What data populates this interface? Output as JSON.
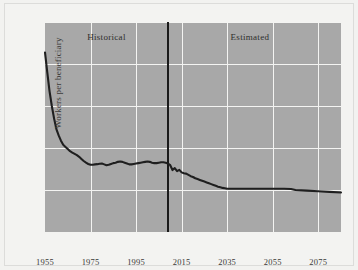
{
  "chart_data": {
    "type": "line",
    "title": "",
    "subtitle": "",
    "xlabel": "",
    "ylabel": "Workers per beneficiary",
    "xlim": [
      1955,
      2085
    ],
    "ylim": [
      0,
      10
    ],
    "grid": true,
    "legend_position": "none",
    "y_ticks": [
      "10",
      "8",
      "6",
      "4",
      "2",
      "0"
    ],
    "y_tick_values": [
      10,
      8,
      6,
      4,
      2,
      0
    ],
    "x_ticks": [
      "1955",
      "1975",
      "1995",
      "2015",
      "2035",
      "2055",
      "2075"
    ],
    "x_tick_values": [
      1955,
      1975,
      1995,
      2015,
      2035,
      2055,
      2075
    ],
    "annotations": [
      {
        "text": "Historical",
        "x": 1982,
        "y": 9.3
      },
      {
        "text": "Estimated",
        "x": 2045,
        "y": 9.3
      }
    ],
    "divider": {
      "x": 2009,
      "label": "historical-estimated-boundary"
    },
    "colors": {
      "plot_background": "#a8a8a8",
      "figure_background": "#f3f3f1",
      "gridline": "#f4f4f2",
      "series_line": "#1f1f1f",
      "divider_line": "#1a1a1a",
      "tick_text": "#3a3a38"
    },
    "series": [
      {
        "name": "Workers per beneficiary",
        "x": [
          1955,
          1956,
          1957,
          1958,
          1959,
          1960,
          1961,
          1962,
          1963,
          1964,
          1965,
          1966,
          1967,
          1968,
          1969,
          1970,
          1971,
          1972,
          1973,
          1974,
          1975,
          1976,
          1977,
          1978,
          1979,
          1980,
          1981,
          1982,
          1983,
          1984,
          1985,
          1986,
          1987,
          1988,
          1989,
          1990,
          1991,
          1992,
          1993,
          1994,
          1995,
          1996,
          1997,
          1998,
          1999,
          2000,
          2001,
          2002,
          2003,
          2004,
          2005,
          2006,
          2007,
          2008,
          2009,
          2010,
          2011,
          2012,
          2013,
          2014,
          2015,
          2016,
          2017,
          2018,
          2019,
          2020,
          2021,
          2022,
          2023,
          2024,
          2025,
          2026,
          2027,
          2028,
          2029,
          2030,
          2031,
          2032,
          2033,
          2034,
          2035,
          2040,
          2045,
          2050,
          2055,
          2060,
          2063,
          2065,
          2070,
          2075,
          2080,
          2085
        ],
        "y": [
          8.55,
          7.6,
          6.7,
          6.0,
          5.4,
          4.9,
          4.6,
          4.35,
          4.15,
          4.05,
          3.95,
          3.85,
          3.78,
          3.72,
          3.66,
          3.58,
          3.48,
          3.38,
          3.3,
          3.24,
          3.2,
          3.2,
          3.22,
          3.23,
          3.25,
          3.26,
          3.22,
          3.18,
          3.2,
          3.24,
          3.28,
          3.3,
          3.34,
          3.36,
          3.34,
          3.3,
          3.26,
          3.22,
          3.22,
          3.24,
          3.26,
          3.28,
          3.3,
          3.32,
          3.34,
          3.36,
          3.34,
          3.3,
          3.28,
          3.28,
          3.3,
          3.32,
          3.32,
          3.3,
          3.26,
          3.18,
          2.95,
          3.04,
          2.9,
          2.96,
          2.84,
          2.8,
          2.78,
          2.72,
          2.66,
          2.62,
          2.56,
          2.52,
          2.48,
          2.44,
          2.4,
          2.36,
          2.32,
          2.28,
          2.24,
          2.2,
          2.16,
          2.13,
          2.1,
          2.08,
          2.06,
          2.06,
          2.06,
          2.06,
          2.06,
          2.06,
          2.05,
          2.0,
          1.97,
          1.94,
          1.91,
          1.88
        ]
      }
    ]
  }
}
